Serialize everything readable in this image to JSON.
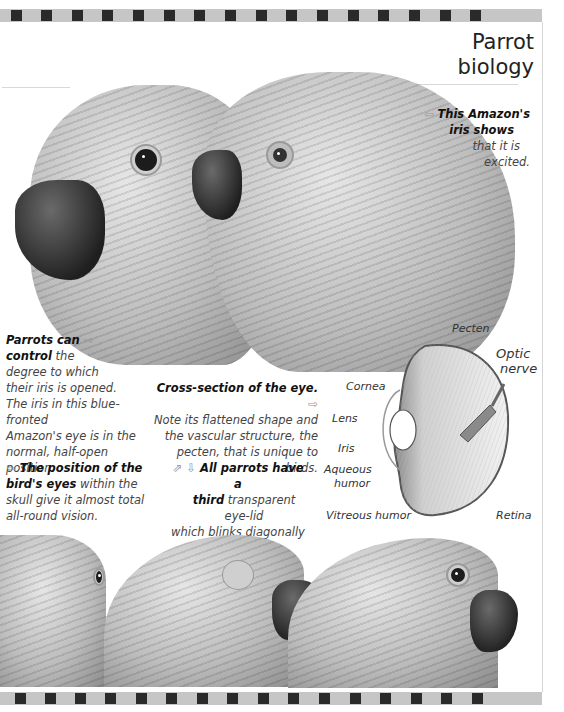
{
  "page": {
    "title_line1": "Parrot",
    "title_line2": "biology",
    "top_stripe_segments": 16,
    "bottom_stripe_segments": 16
  },
  "captions": {
    "excited_iris": {
      "arrow": "⇦",
      "bold_1": "This Amazon's",
      "bold_2": "iris shows",
      "line_3": "that it is",
      "line_4": "excited."
    },
    "iris_control": {
      "bold_1": "Parrots can",
      "arrow": "⇨",
      "bold_2": "control",
      "rest_2": " the",
      "line_3": "degree to which",
      "line_4": "their iris is opened.",
      "line_5": "The iris in this blue-fronted",
      "line_6": "Amazon's eye is in the",
      "line_7": "normal, half-open position."
    },
    "cross_section": {
      "bold_1": "Cross-section of the eye.",
      "arrow": "⇨",
      "line_2": "Note its flattened shape and",
      "line_3": "the vascular structure, the",
      "line_4": "pecten, that is unique to birds."
    },
    "eye_position": {
      "arrow": "⇦",
      "bold_1": "The position of the",
      "bold_2": "bird's eyes",
      "rest_2": " within the",
      "line_3": "skull give it almost total",
      "line_4": "all-round vision."
    },
    "third_eyelid": {
      "arrows": "⇗ ⇩",
      "bold_1": "All parrots have a",
      "bold_2": "third",
      "rest_2": " transparent eye-lid",
      "line_3": "which blinks diagonally",
      "line_4": "across the eye."
    }
  },
  "eye_diagram": {
    "labels": {
      "pecten": "Pecten",
      "optic_nerve_1": "Optic",
      "optic_nerve_2": "nerve",
      "cornea": "Cornea",
      "lens": "Lens",
      "iris": "Iris",
      "aqueous_1": "Aqueous",
      "aqueous_2": "humor",
      "vitreous": "Vitreous humor",
      "retina": "Retina"
    }
  },
  "colors": {
    "stripe_light": "#c6c6c6",
    "stripe_dark": "#2a2a2a",
    "text": "#444444",
    "bold_text": "#111111"
  }
}
